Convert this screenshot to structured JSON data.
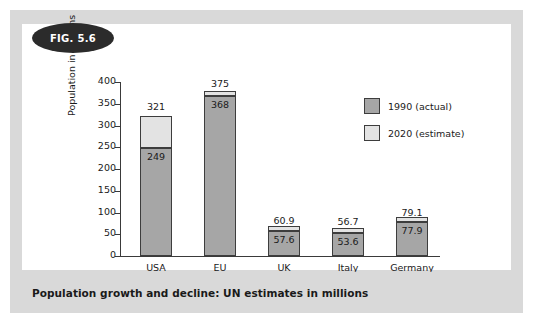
{
  "figure": {
    "badge_label": "FIG. 5.6",
    "caption": "Population growth and decline: UN estimates in millions"
  },
  "colors": {
    "frame": "#d9d9d9",
    "panel": "#ffffff",
    "badge": "#2b2b2b",
    "bar_actual": "#a6a6a6",
    "bar_estimate": "#e3e3e3",
    "outline": "#3d3d3d",
    "axis": "#3a3a3a",
    "text": "#1a1a1a"
  },
  "chart_data": {
    "type": "bar",
    "title": "Population growth and decline: UN estimates in millions",
    "xlabel": "",
    "ylabel": "Population in millions",
    "ylim": [
      0,
      400
    ],
    "yticks": [
      0,
      50,
      100,
      150,
      200,
      250,
      300,
      350,
      400
    ],
    "ytick_labels": [
      "0",
      "50",
      "100",
      "150",
      "200",
      "250",
      "300",
      "350",
      "400"
    ],
    "grid": false,
    "stacked": false,
    "legend_position": "upper right",
    "categories": [
      "USA",
      "EU",
      "UK",
      "Italy",
      "Germany"
    ],
    "series": [
      {
        "name": "1990 (actual)",
        "color": "#a6a6a6",
        "values": [
          249,
          368,
          57.6,
          53.6,
          77.9
        ],
        "labels": [
          "249",
          "368",
          "57.6",
          "53.6",
          "77.9"
        ]
      },
      {
        "name": "2020 (estimate)",
        "color": "#e3e3e3",
        "values": [
          321,
          375,
          60.9,
          56.7,
          79.1
        ],
        "labels": [
          "321",
          "375",
          "60.9",
          "56.7",
          "79.1"
        ]
      }
    ],
    "legend": [
      {
        "label": "1990 (actual)",
        "swatch": "actual"
      },
      {
        "label": "2020 (estimate)",
        "swatch": "estimate"
      }
    ],
    "bars": [
      {
        "category": "USA",
        "actual": 249,
        "actual_label": "249",
        "estimate": 321,
        "estimate_label": "321"
      },
      {
        "category": "EU",
        "actual": 368,
        "actual_label": "368",
        "estimate": 375,
        "estimate_label": "375"
      },
      {
        "category": "UK",
        "actual": 57.6,
        "actual_label": "57.6",
        "estimate": 60.9,
        "estimate_label": "60.9"
      },
      {
        "category": "Italy",
        "actual": 53.6,
        "actual_label": "53.6",
        "estimate": 56.7,
        "estimate_label": "56.7"
      },
      {
        "category": "Germany",
        "actual": 77.9,
        "actual_label": "77.9",
        "estimate": 79.1,
        "estimate_label": "79.1"
      }
    ]
  }
}
